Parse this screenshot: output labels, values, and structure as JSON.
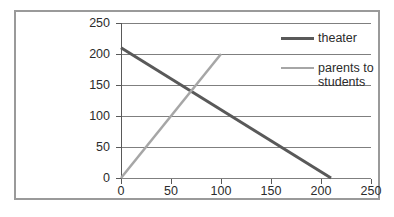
{
  "chart_data": {
    "type": "line",
    "title": "",
    "xlabel": "",
    "ylabel": "",
    "xlim": [
      0,
      250
    ],
    "ylim": [
      0,
      250
    ],
    "xticks": [
      0,
      50,
      100,
      150,
      200,
      250
    ],
    "yticks": [
      0,
      50,
      100,
      150,
      200,
      250
    ],
    "xtick_labels": [
      "0",
      "50",
      "100",
      "150",
      "200",
      "250"
    ],
    "ytick_labels": [
      "0",
      "50",
      "100",
      "150",
      "200",
      "250"
    ],
    "grid": "horizontal",
    "legend_position": "right",
    "series": [
      {
        "name": "theater",
        "color": "#595959",
        "width": 3,
        "points": [
          [
            0,
            210
          ],
          [
            210,
            0
          ]
        ]
      },
      {
        "name": "parents to students",
        "color": "#a6a6a6",
        "width": 2.5,
        "points": [
          [
            0,
            0
          ],
          [
            100,
            200
          ]
        ]
      }
    ],
    "annotations": []
  },
  "legend": {
    "items": [
      {
        "label": "theater",
        "color": "#595959"
      },
      {
        "label": "parents to students",
        "color": "#a6a6a6"
      }
    ]
  },
  "axes": {
    "y_labels": [
      "250",
      "200",
      "150",
      "100",
      "50",
      "0"
    ],
    "x_labels": [
      "0",
      "50",
      "100",
      "150",
      "200",
      "250"
    ]
  },
  "style": {
    "border_color": "#9a9a9a",
    "gridline_color": "#7f7f7f",
    "axis_color": "#595959",
    "text_color": "#2b2b2b",
    "background": "#ffffff"
  }
}
